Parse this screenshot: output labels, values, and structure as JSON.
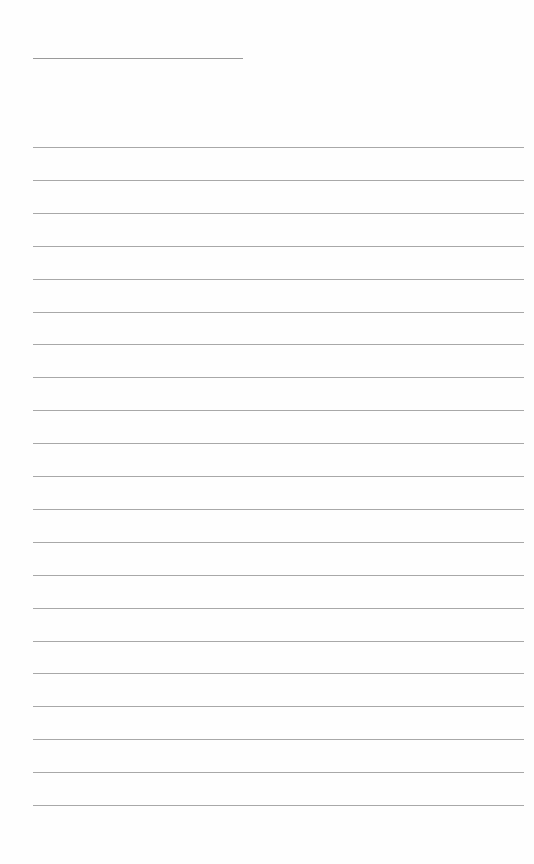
{
  "page": {
    "type": "blank lined writing page",
    "header_line": {
      "left": 33,
      "top": 58,
      "width": 210
    },
    "rules": {
      "count": 21,
      "first_top": 147,
      "spacing": 32.9,
      "left": 33,
      "width": 491
    },
    "colors": {
      "background": "#fefefe",
      "line": "#a8a8a8"
    }
  }
}
